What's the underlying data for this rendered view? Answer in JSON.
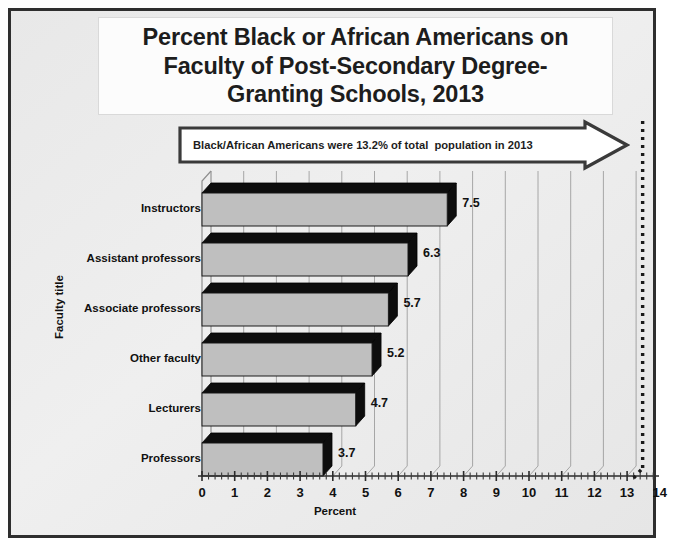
{
  "title_lines": [
    "Percent Black or African Americans on",
    "Faculty of Post-Secondary Degree-",
    "Granting Schools, 2013"
  ],
  "banner": {
    "text": "Black/African Americans were 13.2% of total  population in 2013",
    "arrow_direction": "right",
    "border_color": "#3a3a3a",
    "fill_color": "#ffffff"
  },
  "colors": {
    "frame": "#2e2e2e",
    "canvas": "#e9e9e9",
    "bar_face": "#bfbfbf",
    "bar_side": "#0d0d0d",
    "bar_top": "#0d0d0d",
    "gridline": "#8f8f8f",
    "reference_line": "#1a1a1a",
    "text": "#111111"
  },
  "chart_data": {
    "type": "bar",
    "orientation": "horizontal",
    "xlabel": "Percent",
    "ylabel": "Faculty title",
    "categories": [
      "Instructors",
      "Assistant professors",
      "Associate professors",
      "Other faculty",
      "Lecturers",
      "Professors"
    ],
    "values": [
      7.5,
      6.3,
      5.7,
      5.2,
      4.7,
      3.7
    ],
    "data_labels": [
      "7.5",
      "6.3",
      "5.7",
      "5.2",
      "4.7",
      "3.7"
    ],
    "xlim": [
      0,
      14
    ],
    "xticks": [
      0,
      1,
      2,
      3,
      4,
      5,
      6,
      7,
      8,
      9,
      10,
      11,
      12,
      13,
      14
    ],
    "xtick_labels": [
      "0",
      "1",
      "2",
      "3",
      "4",
      "5",
      "6",
      "7",
      "8",
      "9",
      "10",
      "11",
      "12",
      "13",
      "14"
    ],
    "minor_ticks_per_interval": 5,
    "grid": true,
    "grid_axis": "x",
    "legend": false,
    "style": "3d",
    "annotations": [
      {
        "type": "reference-line",
        "value": 13.2,
        "style": "dotted",
        "label": "Black/African Americans were 13.2% of total  population in 2013"
      }
    ]
  }
}
